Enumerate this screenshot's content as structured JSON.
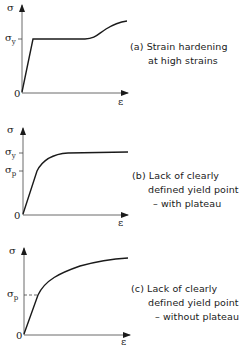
{
  "panels": [
    {
      "id": "a",
      "caption_line1": "(a) Strain hardening",
      "caption_line2": "at high strains",
      "caption_line3": "",
      "y_axis_label": "σ",
      "x_axis_label": "ε",
      "origin_label": "0",
      "marks": [
        {
          "symbol": "σ",
          "sub": "y"
        }
      ]
    },
    {
      "id": "b",
      "caption_line1": "(b) Lack of clearly",
      "caption_line2": "defined yield point",
      "caption_line3": "– with plateau",
      "y_axis_label": "σ",
      "x_axis_label": "ε",
      "origin_label": "0",
      "marks": [
        {
          "symbol": "σ",
          "sub": "y"
        },
        {
          "symbol": "σ",
          "sub": "p"
        }
      ]
    },
    {
      "id": "c",
      "caption_line1": "(c) Lack of clearly",
      "caption_line2": "defined yield point",
      "caption_line3": "– without plateau",
      "y_axis_label": "σ",
      "x_axis_label": "ε",
      "origin_label": "0",
      "marks": [
        {
          "symbol": "σ",
          "sub": "p"
        }
      ]
    }
  ],
  "colors": {
    "line": "#1a1a1a",
    "axis": "#333333",
    "background": "#ffffff"
  }
}
